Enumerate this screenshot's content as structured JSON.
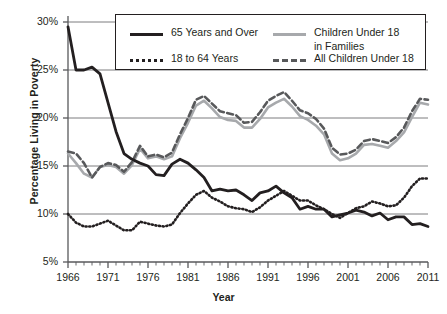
{
  "axes": {
    "ylabel": "Percentage Living in Poverty",
    "xlabel": "Year",
    "yticks": [
      "30%",
      "25%",
      "20%",
      "15%",
      "10%",
      "5%"
    ],
    "xticks": [
      "1966",
      "1971",
      "1976",
      "1981",
      "1986",
      "1991",
      "1996",
      "2001",
      "2006",
      "2011"
    ]
  },
  "legend": {
    "items": [
      {
        "label": "65 Years and Over",
        "style": "solid-black",
        "color": "#231f20"
      },
      {
        "label": "Children Under 18",
        "label2": "in Families",
        "style": "solid-grey",
        "color": "#a7a9ac"
      },
      {
        "label": "18 to 64 Years",
        "style": "dotted-black",
        "color": "#231f20"
      },
      {
        "label": "All Children Under 18",
        "style": "dashed-grey",
        "color": "#58595b"
      }
    ]
  },
  "chart_data": {
    "type": "line",
    "title": "",
    "xlabel": "Year",
    "ylabel": "Percentage Living in Poverty",
    "xlim": [
      1966,
      2011
    ],
    "ylim": [
      5,
      30
    ],
    "ytick_values": [
      5,
      10,
      15,
      20,
      25,
      30
    ],
    "xtick_values": [
      1966,
      1971,
      1976,
      1981,
      1986,
      1991,
      1996,
      2001,
      2006,
      2011
    ],
    "grid": "horizontal",
    "legend_position": "top-center",
    "x": [
      1966,
      1967,
      1968,
      1969,
      1970,
      1971,
      1972,
      1973,
      1974,
      1975,
      1976,
      1977,
      1978,
      1979,
      1980,
      1981,
      1982,
      1983,
      1984,
      1985,
      1986,
      1987,
      1988,
      1989,
      1990,
      1991,
      1992,
      1993,
      1994,
      1995,
      1996,
      1997,
      1998,
      1999,
      2000,
      2001,
      2002,
      2003,
      2004,
      2005,
      2006,
      2007,
      2008,
      2009,
      2010,
      2011
    ],
    "series": [
      {
        "name": "65 Years and Over",
        "style": "solid-black",
        "color": "#231f20",
        "values": [
          29.5,
          25.0,
          25.0,
          25.3,
          24.6,
          21.6,
          18.6,
          16.3,
          15.7,
          15.3,
          15.0,
          14.1,
          14.0,
          15.2,
          15.7,
          15.3,
          14.6,
          13.8,
          12.4,
          12.6,
          12.4,
          12.5,
          12.0,
          11.4,
          12.2,
          12.4,
          12.9,
          12.2,
          11.7,
          10.5,
          10.8,
          10.5,
          10.5,
          9.7,
          9.9,
          10.1,
          10.4,
          10.2,
          9.8,
          10.1,
          9.4,
          9.7,
          9.7,
          8.9,
          9.0,
          8.7
        ]
      },
      {
        "name": "18 to 64 Years",
        "style": "dotted-black",
        "color": "#231f20",
        "values": [
          10.0,
          9.1,
          8.7,
          8.7,
          9.0,
          9.3,
          8.8,
          8.3,
          8.3,
          9.2,
          9.0,
          8.8,
          8.7,
          8.9,
          10.1,
          11.1,
          12.0,
          12.4,
          11.7,
          11.3,
          10.8,
          10.6,
          10.5,
          10.2,
          10.7,
          11.4,
          11.9,
          12.4,
          11.9,
          11.4,
          11.4,
          10.9,
          10.5,
          10.0,
          9.6,
          10.1,
          10.6,
          10.8,
          11.3,
          11.1,
          10.8,
          10.9,
          11.7,
          12.9,
          13.7,
          13.7
        ]
      },
      {
        "name": "Children Under 18 in Families",
        "style": "solid-grey",
        "color": "#a7a9ac",
        "values": [
          16.3,
          15.3,
          14.2,
          13.8,
          14.9,
          15.1,
          14.9,
          14.2,
          15.1,
          16.8,
          15.8,
          16.0,
          15.7,
          16.0,
          17.9,
          19.5,
          21.3,
          21.8,
          21.0,
          20.1,
          19.8,
          19.7,
          19.0,
          19.0,
          19.9,
          21.1,
          21.6,
          22.0,
          21.2,
          20.2,
          19.8,
          19.2,
          18.3,
          16.3,
          15.6,
          15.8,
          16.3,
          17.2,
          17.3,
          17.1,
          16.9,
          17.6,
          18.5,
          20.1,
          21.6,
          21.4
        ]
      },
      {
        "name": "All Children Under 18",
        "style": "dashed-grey",
        "color": "#58595b",
        "values": [
          16.5,
          16.3,
          15.3,
          13.8,
          14.9,
          15.3,
          15.1,
          14.4,
          15.4,
          17.1,
          16.0,
          16.2,
          15.9,
          16.4,
          18.3,
          20.0,
          21.9,
          22.3,
          21.5,
          20.7,
          20.5,
          20.3,
          19.5,
          19.6,
          20.6,
          21.8,
          22.3,
          22.7,
          21.8,
          20.8,
          20.5,
          19.9,
          18.9,
          16.9,
          16.2,
          16.3,
          16.7,
          17.6,
          17.8,
          17.6,
          17.4,
          18.0,
          19.0,
          20.7,
          22.0,
          21.9
        ]
      }
    ]
  }
}
